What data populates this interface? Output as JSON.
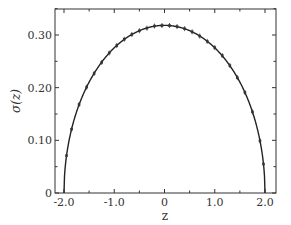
{
  "chart_data": {
    "type": "line",
    "title": "",
    "xlabel": "z",
    "ylabel": "σ(z)",
    "xlim": [
      -2.2,
      2.2
    ],
    "ylim": [
      0,
      0.35
    ],
    "xticks": [
      -2.0,
      -1.0,
      0,
      1.0,
      2.0
    ],
    "xtick_labels": [
      "-2.0",
      "-1.0",
      "0",
      "1.0",
      "2.0"
    ],
    "yticks": [
      0,
      0.1,
      0.2,
      0.3
    ],
    "ytick_labels": [
      "0",
      "0.10",
      "0.20",
      "0.30"
    ],
    "grid": false,
    "legend": null,
    "series": [
      {
        "name": "semicircle density",
        "style": "line with point markers",
        "formula": "sqrt(4 - z^2) / (2*pi)",
        "x": [
          -1.95,
          -1.85,
          -1.7,
          -1.55,
          -1.4,
          -1.25,
          -1.1,
          -0.95,
          -0.8,
          -0.65,
          -0.5,
          -0.35,
          -0.2,
          -0.05,
          0.1,
          0.25,
          0.4,
          0.55,
          0.7,
          0.85,
          1.0,
          1.15,
          1.3,
          1.45,
          1.6,
          1.75,
          1.9,
          1.97
        ],
        "y": [
          0.071,
          0.121,
          0.168,
          0.201,
          0.227,
          0.248,
          0.266,
          0.28,
          0.292,
          0.301,
          0.308,
          0.313,
          0.317,
          0.318,
          0.318,
          0.316,
          0.312,
          0.306,
          0.298,
          0.288,
          0.276,
          0.261,
          0.242,
          0.219,
          0.191,
          0.154,
          0.099,
          0.055
        ]
      }
    ]
  }
}
